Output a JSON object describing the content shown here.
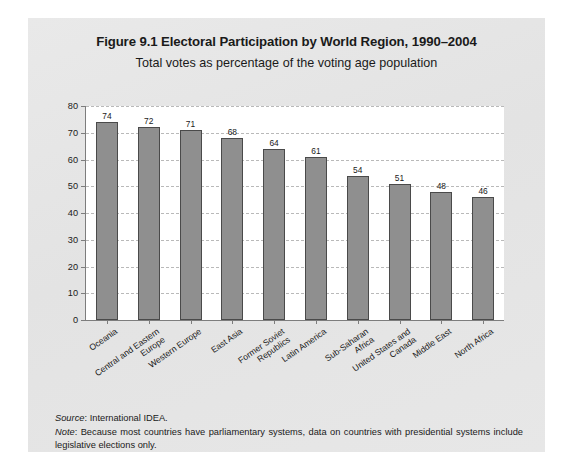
{
  "figure": {
    "title": "Figure 9.1 Electoral Participation by World Region, 1990–2004",
    "subtitle": "Total votes as percentage of the voting age population",
    "source_label": "Source",
    "source_text": ": International IDEA.",
    "note_label": "Note",
    "note_text": ": Because most countries have parliamentary systems, data on countries with presidential systems include legislative elections only."
  },
  "colors": {
    "panel_background": "#e6e6e6",
    "plot_background": "#ffffff",
    "bar_fill": "#8f8f8f",
    "bar_stroke": "#4a4a4a",
    "axis": "#7d7d7d",
    "gridline": "#b9b9b9",
    "text": "#1a1a1a"
  },
  "chart_data": {
    "type": "bar",
    "title": "Figure 9.1 Electoral Participation by World Region, 1990–2004",
    "subtitle": "Total votes as percentage of the voting age population",
    "xlabel": "",
    "ylabel": "",
    "ylim": [
      0,
      80
    ],
    "yticks": [
      0,
      10,
      20,
      30,
      40,
      50,
      60,
      70,
      80
    ],
    "ytick_labels": [
      "0",
      "10",
      "20",
      "30",
      "40",
      "50",
      "60",
      "70",
      "80"
    ],
    "grid": true,
    "grid_axis": "y",
    "grid_style": "dashed",
    "legend": false,
    "label_rotation": -35,
    "categories": [
      "Oceania",
      "Central and Eastern\nEurope",
      "Western Europe",
      "East Asia",
      "Former Soviet\nRepublics",
      "Latin America",
      "Sub-Saharan\nAfrica",
      "United States and\nCanada",
      "Middle East",
      "North Africa"
    ],
    "values": [
      74,
      72,
      71,
      68,
      64,
      61,
      54,
      51,
      48,
      46
    ],
    "value_labels": [
      "74",
      "72",
      "71",
      "68",
      "64",
      "61",
      "54",
      "51",
      "48",
      "46"
    ]
  }
}
